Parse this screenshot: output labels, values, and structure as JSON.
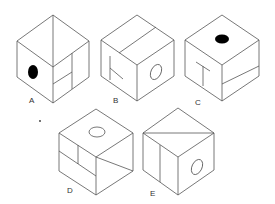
{
  "figure": {
    "type": "cube-folding-puzzle",
    "options": [
      {
        "label": "A",
        "top_face": "diagonal split",
        "left_face": "black filled ellipse",
        "right_face": "vertical line with horizontal sub-divisions"
      },
      {
        "label": "B",
        "top_face": "line parallel to edge",
        "left_face": "T shape rotated (K-like)",
        "right_face": "hollow ellipse"
      },
      {
        "label": "C",
        "top_face": "black filled ellipse",
        "left_face": "T shape",
        "right_face": "horizontal split line"
      },
      {
        "label": "D",
        "top_face": "hollow ellipse",
        "left_face": "grid of rectangles",
        "right_face": "diagonal line"
      },
      {
        "label": "E",
        "top_face": "diagonal split",
        "left_face": "vertical line",
        "right_face": "hollow ellipse"
      }
    ],
    "colors": {
      "line": "#555555",
      "fill": "#000000",
      "background": "#ffffff"
    }
  }
}
